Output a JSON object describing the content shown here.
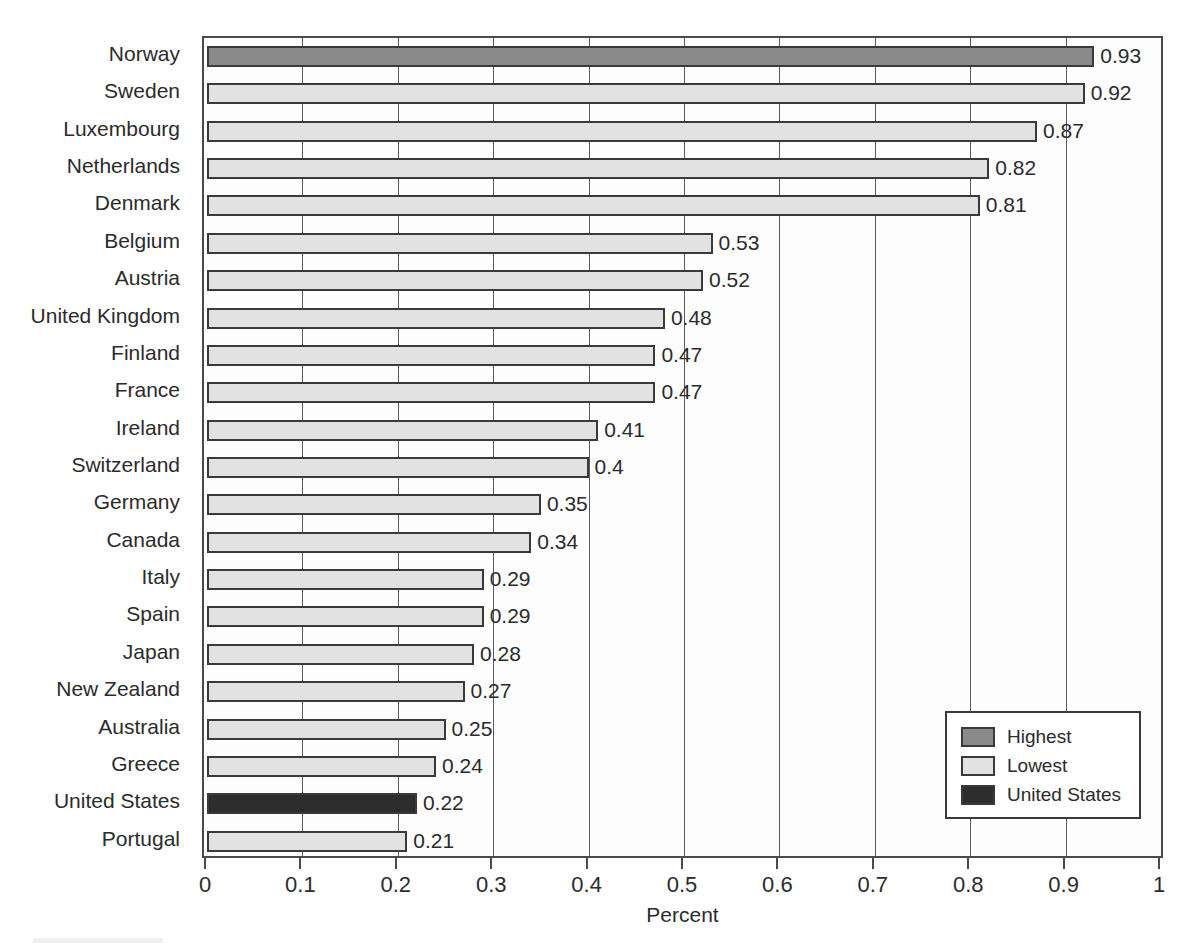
{
  "chart_data": {
    "type": "bar",
    "orientation": "horizontal",
    "title": "",
    "xlabel": "Percent",
    "ylabel": "",
    "xlim": [
      0,
      1
    ],
    "xticks": [
      "0",
      "0.1",
      "0.2",
      "0.3",
      "0.4",
      "0.5",
      "0.6",
      "0.7",
      "0.8",
      "0.9",
      "1"
    ],
    "grid": true,
    "grid_axis": "x",
    "legend_position": "bottom-right",
    "categories": [
      "Norway",
      "Sweden",
      "Luxembourg",
      "Netherlands",
      "Denmark",
      "Belgium",
      "Austria",
      "United Kingdom",
      "Finland",
      "France",
      "Ireland",
      "Switzerland",
      "Germany",
      "Canada",
      "Italy",
      "Spain",
      "Japan",
      "New Zealand",
      "Australia",
      "Greece",
      "United States",
      "Portugal"
    ],
    "values": [
      0.93,
      0.92,
      0.87,
      0.82,
      0.81,
      0.53,
      0.52,
      0.48,
      0.47,
      0.47,
      0.41,
      0.4,
      0.35,
      0.34,
      0.29,
      0.29,
      0.28,
      0.27,
      0.25,
      0.24,
      0.22,
      0.21
    ],
    "value_labels": [
      "0.93",
      "0.92",
      "0.87",
      "0.82",
      "0.81",
      "0.53",
      "0.52",
      "0.48",
      "0.47",
      "0.47",
      "0.41",
      "0.4",
      "0.35",
      "0.34",
      "0.29",
      "0.29",
      "0.28",
      "0.27",
      "0.25",
      "0.24",
      "0.22",
      "0.21"
    ],
    "bar_styles": [
      "highest",
      "lowest",
      "lowest",
      "lowest",
      "lowest",
      "lowest",
      "lowest",
      "lowest",
      "lowest",
      "lowest",
      "lowest",
      "lowest",
      "lowest",
      "lowest",
      "lowest",
      "lowest",
      "lowest",
      "lowest",
      "lowest",
      "lowest",
      "united_states",
      "lowest"
    ]
  },
  "legend": {
    "items": [
      {
        "label": "Highest",
        "color": "#8a8a8a",
        "style": "highest"
      },
      {
        "label": "Lowest",
        "color": "#e2e2e2",
        "style": "lowest"
      },
      {
        "label": "United States",
        "color": "#2d2d2d",
        "style": "united_states"
      }
    ]
  },
  "colors": {
    "highest": "#8a8a8a",
    "lowest": "#e2e2e2",
    "united_states": "#2d2d2d",
    "bar_border": "#3a3a3a",
    "gridline": "#5a5a5a",
    "plot_border": "#4a4a4a",
    "plot_background": "#fdfdfd",
    "text": "#2b2b2b",
    "page_background": "#ffffff"
  },
  "axis": {
    "x_title": "Percent"
  }
}
